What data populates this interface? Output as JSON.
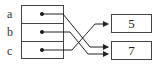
{
  "diagram": {
    "cells": [
      {
        "label": "a",
        "points_to": "7"
      },
      {
        "label": "b",
        "points_to": "7"
      },
      {
        "label": "c",
        "points_to": "5"
      }
    ],
    "values": [
      {
        "value": "5"
      },
      {
        "value": "7"
      }
    ]
  }
}
